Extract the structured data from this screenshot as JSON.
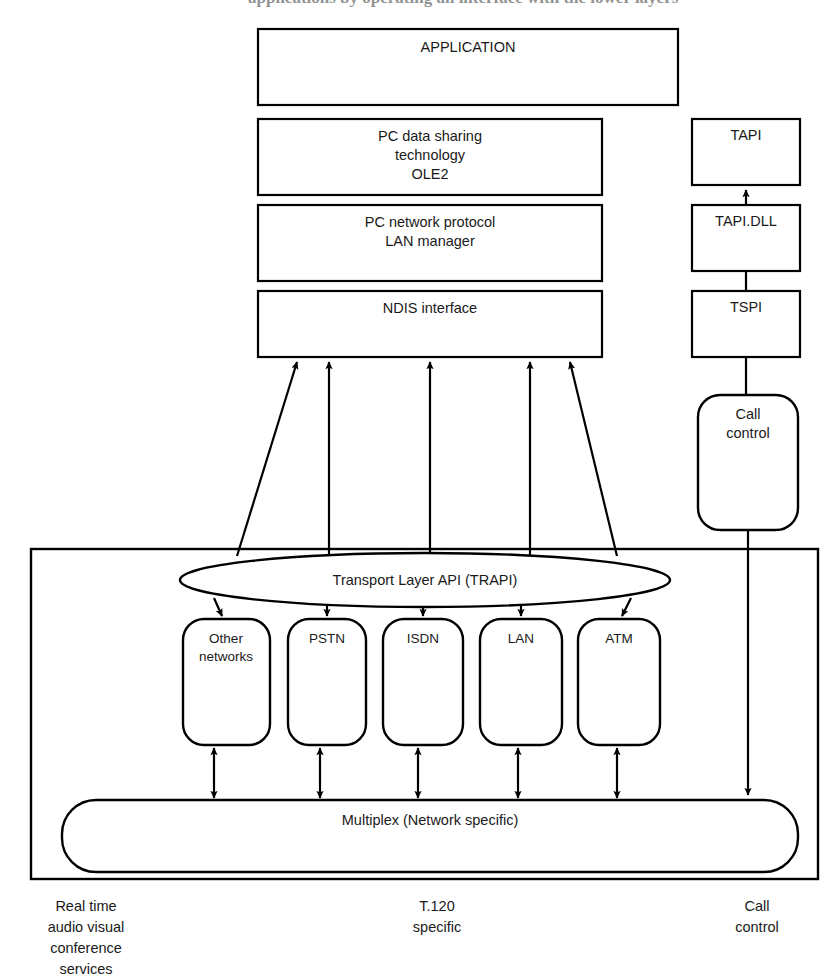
{
  "figure": {
    "cropped_header_text": "applications by operating an interface with the lower layers"
  },
  "stack_left": {
    "application": "APPLICATION",
    "data_sharing": {
      "line1": "PC data sharing",
      "line2": "technology",
      "line3": "OLE2"
    },
    "network_protocol": {
      "line1": "PC network protocol",
      "line2": "LAN manager"
    },
    "ndis": "NDIS interface"
  },
  "stack_right": {
    "tapi": "TAPI",
    "tapi_dll": "TAPI.DLL",
    "tspi": "TSPI",
    "call_control": {
      "line1": "Call",
      "line2": "control"
    }
  },
  "transport": {
    "api_ellipse": "Transport Layer API (TRAPI)",
    "networks": [
      {
        "name": "other-networks",
        "line1": "Other",
        "line2": "networks"
      },
      {
        "name": "pstn",
        "line1": "PSTN",
        "line2": ""
      },
      {
        "name": "isdn",
        "line1": "ISDN",
        "line2": ""
      },
      {
        "name": "lan",
        "line1": "LAN",
        "line2": ""
      },
      {
        "name": "atm",
        "line1": "ATM",
        "line2": ""
      }
    ],
    "multiplex": "Multiplex (Network specific)"
  },
  "captions": {
    "left": {
      "line1": "Real time",
      "line2": "audio visual",
      "line3": "conference",
      "line4": "services"
    },
    "center": {
      "line1": "T.120",
      "line2": "specific"
    },
    "right": {
      "line1": "Call",
      "line2": "control"
    }
  },
  "colors": {
    "stroke": "#000000",
    "fill": "#ffffff",
    "text": "#1a1a1a"
  }
}
